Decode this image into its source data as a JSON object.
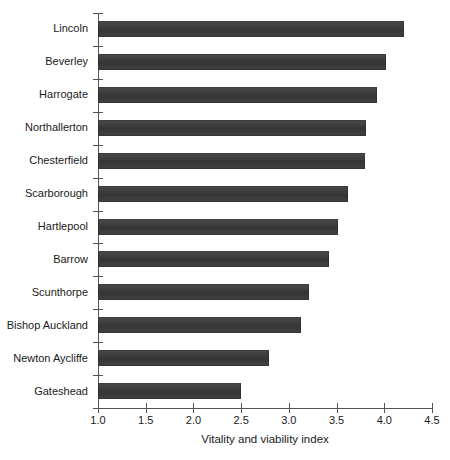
{
  "chart_data": {
    "type": "bar",
    "orientation": "horizontal",
    "title": "",
    "subtitle": "",
    "xlabel": "Vitality and viability index",
    "ylabel": "",
    "xlim": [
      1.0,
      4.5
    ],
    "xticks": [
      "1.0",
      "1.5",
      "2.0",
      "2.5",
      "3.0",
      "3.5",
      "4.0",
      "4.5"
    ],
    "xtick_values": [
      1.0,
      1.5,
      2.0,
      2.5,
      3.0,
      3.5,
      4.0,
      4.5
    ],
    "grid": false,
    "legend": false,
    "legend_position": "none",
    "bar_color": "#3c3c3c",
    "axis_color": "#555555",
    "background_color": "#ffffff",
    "categories": [
      "Lincoln",
      "Beverley",
      "Harrogate",
      "Northallerton",
      "Chesterfield",
      "Scarborough",
      "Hartlepool",
      "Barrow",
      "Scunthorpe",
      "Bishop Auckland",
      "Newton Aycliffe",
      "Gateshead"
    ],
    "values": [
      4.21,
      4.02,
      3.92,
      3.81,
      3.8,
      3.62,
      3.51,
      3.42,
      3.21,
      3.13,
      2.79,
      2.5
    ]
  }
}
